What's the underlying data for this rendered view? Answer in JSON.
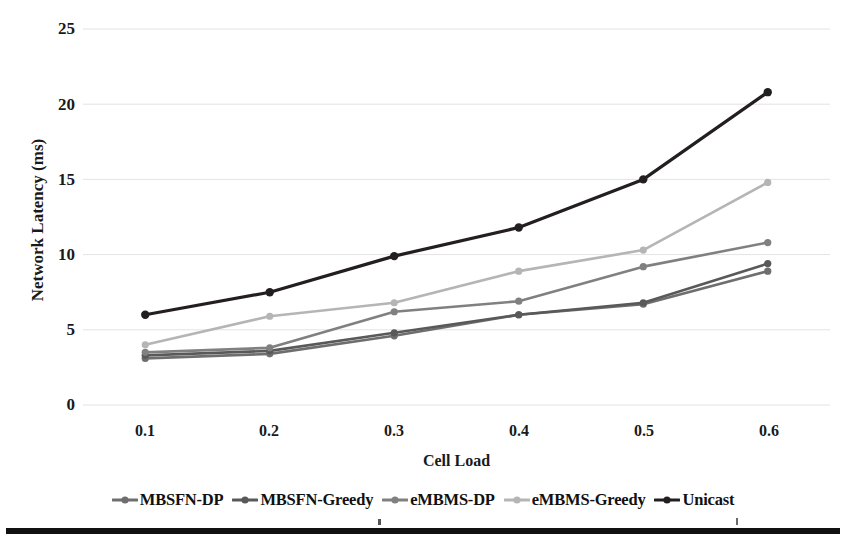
{
  "chart_data": {
    "type": "line",
    "title": "",
    "xlabel": "Cell Load",
    "ylabel": "Network Latency (ms)",
    "x": [
      0.1,
      0.2,
      0.3,
      0.4,
      0.5,
      0.6
    ],
    "categories": [
      "0.1",
      "0.2",
      "0.3",
      "0.4",
      "0.5",
      "0.6"
    ],
    "xtick_labels": [
      "0.1",
      "0.2",
      "0.3",
      "0.4",
      "0.5",
      "0.6"
    ],
    "ytick_labels": [
      "0",
      "5",
      "10",
      "15",
      "20",
      "25"
    ],
    "ylim": [
      0,
      25
    ],
    "ytick_values": [
      0,
      5,
      10,
      15,
      20,
      25
    ],
    "grid": "horizontal",
    "legend_position": "bottom",
    "series": [
      {
        "name": "MBSFN-DP",
        "color": "#6e6e6e",
        "marker": "circle",
        "values": [
          3.1,
          3.4,
          4.6,
          6.0,
          6.7,
          8.9
        ]
      },
      {
        "name": "MBSFN-Greedy",
        "color": "#595959",
        "marker": "circle",
        "values": [
          3.3,
          3.6,
          4.8,
          6.0,
          6.8,
          9.4
        ]
      },
      {
        "name": "eMBMS-DP",
        "color": "#808080",
        "marker": "circle",
        "values": [
          3.5,
          3.8,
          6.2,
          6.9,
          9.2,
          10.8
        ]
      },
      {
        "name": "eMBMS-Greedy",
        "color": "#b5b5b5",
        "marker": "circle",
        "values": [
          4.0,
          5.9,
          6.8,
          8.9,
          10.3,
          14.8
        ]
      },
      {
        "name": "Unicast",
        "color": "#231f20",
        "marker": "circle",
        "values": [
          6.0,
          7.5,
          9.9,
          11.8,
          15.0,
          20.8
        ]
      }
    ]
  },
  "axes": {
    "y_title": "Network Latency (ms)",
    "x_title": "Cell Load",
    "y_ticks": [
      "25",
      "20",
      "15",
      "10",
      "5",
      "0"
    ],
    "x_ticks": [
      "0.1",
      "0.2",
      "0.3",
      "0.4",
      "0.5",
      "0.6"
    ]
  },
  "legend": {
    "items": [
      {
        "label": "MBSFN-DP",
        "color": "#6e6e6e"
      },
      {
        "label": "MBSFN-Greedy",
        "color": "#595959"
      },
      {
        "label": "eMBMS-DP",
        "color": "#808080"
      },
      {
        "label": "eMBMS-Greedy",
        "color": "#b5b5b5"
      },
      {
        "label": "Unicast",
        "color": "#231f20"
      }
    ]
  },
  "style": {
    "gridline_color": "#e3e3e3",
    "background": "#ffffff",
    "text_color": "#1a1a1a",
    "rule_color": "#111111"
  }
}
